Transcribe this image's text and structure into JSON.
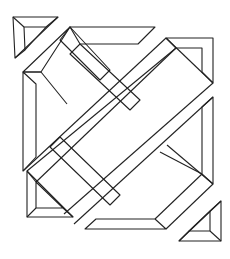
{
  "figure": {
    "stroke_color": "#222222",
    "background": "#ffffff"
  }
}
